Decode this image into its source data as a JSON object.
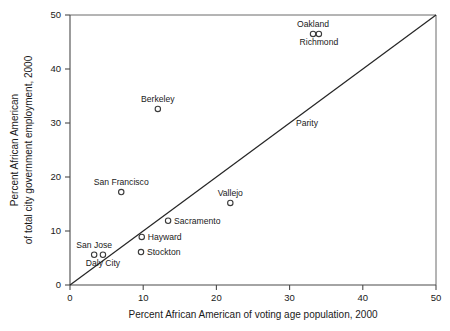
{
  "chart_data": {
    "type": "scatter",
    "title": "",
    "xlabel": "Percent African American of voting age population, 2000",
    "ylabel_line1": "Percent African American",
    "ylabel_line2": "of total city government employment, 2000",
    "xlim": [
      0,
      50
    ],
    "ylim": [
      0,
      50
    ],
    "xticks": [
      0,
      10,
      20,
      30,
      40,
      50
    ],
    "yticks": [
      0,
      10,
      20,
      30,
      40,
      50
    ],
    "xtick_labels": [
      "0",
      "10",
      "20",
      "30",
      "40",
      "50"
    ],
    "ytick_labels": [
      "0",
      "10",
      "20",
      "30",
      "40",
      "50"
    ],
    "grid": false,
    "legend": "none",
    "marker": "open-circle",
    "reference_line": {
      "name": "Parity",
      "label": "Parity",
      "type": "identity",
      "from": [
        0,
        0
      ],
      "to": [
        50,
        50
      ]
    },
    "points": [
      {
        "label": "Oakland",
        "x": 33.2,
        "y": 46.5,
        "label_pos": "above"
      },
      {
        "label": "Richmond",
        "x": 34.0,
        "y": 46.5,
        "label_pos": "below"
      },
      {
        "label": "Berkeley",
        "x": 12.0,
        "y": 32.6,
        "label_pos": "above"
      },
      {
        "label": "San Francisco",
        "x": 7.0,
        "y": 17.2,
        "label_pos": "above"
      },
      {
        "label": "Vallejo",
        "x": 21.9,
        "y": 15.2,
        "label_pos": "above"
      },
      {
        "label": "Sacramento",
        "x": 13.4,
        "y": 11.9,
        "label_pos": "right"
      },
      {
        "label": "Hayward",
        "x": 9.8,
        "y": 8.9,
        "label_pos": "right"
      },
      {
        "label": "Stockton",
        "x": 9.7,
        "y": 6.1,
        "label_pos": "right"
      },
      {
        "label": "San Jose",
        "x": 3.3,
        "y": 5.6,
        "label_pos": "above"
      },
      {
        "label": "Daly City",
        "x": 4.5,
        "y": 5.6,
        "label_pos": "below"
      }
    ],
    "colors": {
      "marker_stroke": "#3a3a3a",
      "axis": "#4a4a4a",
      "parity_line": "#262626",
      "text": "#1a1a1a",
      "background": "#ffffff"
    }
  }
}
